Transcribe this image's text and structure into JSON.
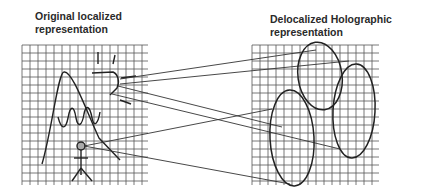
{
  "left_panel": {
    "title_line1": "Original localized",
    "title_line2": "representation",
    "grid": {
      "x": 22,
      "y": 45,
      "width": 126,
      "height": 140,
      "cell": 8
    }
  },
  "right_panel": {
    "title_line1": "Delocalized Holographic",
    "title_line2": "representation",
    "grid": {
      "x": 252,
      "y": 45,
      "width": 127,
      "height": 140,
      "cell": 8
    }
  },
  "colors": {
    "grid": "#555555",
    "stroke": "#222222",
    "head_fill": "#aaaaaa"
  }
}
